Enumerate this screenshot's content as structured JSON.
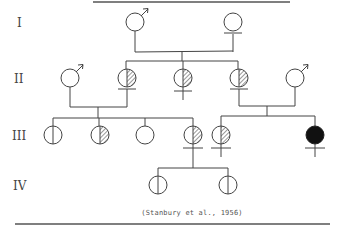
{
  "diagram": {
    "type": "pedigree",
    "citation": "(Stanbury et al., 1956)",
    "colors": {
      "stroke": "#444444",
      "affected_fill": "#111111",
      "background": "#ffffff"
    },
    "generations": [
      {
        "label": "I",
        "y": 22
      },
      {
        "label": "II",
        "y": 78
      },
      {
        "label": "III",
        "y": 135
      },
      {
        "label": "IV",
        "y": 185
      }
    ],
    "individuals": [
      {
        "id": "I-1",
        "gen": "I",
        "sex": "male",
        "x": 135,
        "y": 22,
        "status": "unaffected"
      },
      {
        "id": "I-2",
        "gen": "I",
        "sex": "female",
        "x": 233,
        "y": 22,
        "status": "unaffected"
      },
      {
        "id": "II-1",
        "gen": "II",
        "sex": "male",
        "x": 70,
        "y": 78,
        "status": "unaffected"
      },
      {
        "id": "II-2",
        "gen": "II",
        "sex": "female",
        "x": 127,
        "y": 78,
        "status": "carrier-hatched"
      },
      {
        "id": "II-3",
        "gen": "II",
        "sex": "female",
        "x": 183,
        "y": 78,
        "status": "carrier-hatched"
      },
      {
        "id": "II-4",
        "gen": "II",
        "sex": "female",
        "x": 239,
        "y": 78,
        "status": "carrier-hatched"
      },
      {
        "id": "II-5",
        "gen": "II",
        "sex": "male",
        "x": 295,
        "y": 78,
        "status": "unaffected"
      },
      {
        "id": "III-1",
        "gen": "III",
        "sex": "unspecified",
        "x": 53,
        "y": 135,
        "status": "split-half"
      },
      {
        "id": "III-2",
        "gen": "III",
        "sex": "unspecified",
        "x": 100,
        "y": 135,
        "status": "carrier-hatched"
      },
      {
        "id": "III-3",
        "gen": "III",
        "sex": "unspecified",
        "x": 145,
        "y": 135,
        "status": "unaffected"
      },
      {
        "id": "III-4",
        "gen": "III",
        "sex": "female",
        "x": 193,
        "y": 135,
        "status": "carrier-hatched"
      },
      {
        "id": "III-5",
        "gen": "III",
        "sex": "female",
        "x": 221,
        "y": 135,
        "status": "carrier-hatched"
      },
      {
        "id": "III-6",
        "gen": "III",
        "sex": "female",
        "x": 315,
        "y": 135,
        "status": "affected"
      },
      {
        "id": "IV-1",
        "gen": "IV",
        "sex": "unspecified",
        "x": 158,
        "y": 185,
        "status": "split-half"
      },
      {
        "id": "IV-2",
        "gen": "IV",
        "sex": "unspecified",
        "x": 228,
        "y": 185,
        "status": "split-half"
      }
    ],
    "legend_note": "Symbols: ♂ male, ♀ female; hatched half = partial/carrier; filled = affected; vertical line = split"
  }
}
